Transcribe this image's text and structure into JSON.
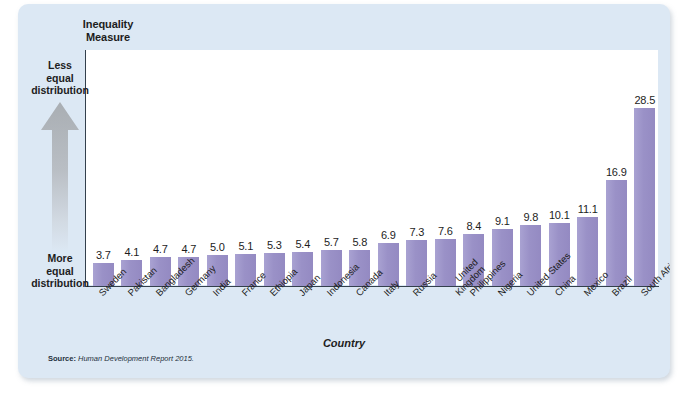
{
  "figure": {
    "y_axis_title": "Inequality\nMeasure",
    "y_axis_title_line1": "Inequality",
    "y_axis_title_line2": "Measure",
    "x_axis_title": "Country",
    "top_annotation": "Less\nequal\ndistribution",
    "top_annotation_line1": "Less",
    "top_annotation_line2": "equal",
    "top_annotation_line3": "distribution",
    "bottom_annotation_line1": "More",
    "bottom_annotation_line2": "equal",
    "bottom_annotation_line3": "distribution",
    "arrow_direction": "up",
    "source_label": "Source:",
    "source_text": "Human Development Report 2015.",
    "bar_color": "#9b93ca",
    "panel_color": "#dce8f4",
    "plot_color": "#ffffff",
    "axis_color": "#33404d"
  },
  "chart_data": {
    "type": "bar",
    "title": "",
    "xlabel": "Country",
    "ylabel": "Inequality Measure",
    "ylim": [
      0,
      30
    ],
    "grid": false,
    "legend": "none",
    "categories": [
      "Sweden",
      "Pakistan",
      "Bangladesh",
      "Germany",
      "India",
      "France",
      "Ethiopia",
      "Japan",
      "Indonesia",
      "Canada",
      "Italy",
      "Russia",
      "United Kingdom",
      "Philippines",
      "Nigeria",
      "United States",
      "China",
      "Mexico",
      "Brazil",
      "South Africa"
    ],
    "values": [
      3.7,
      4.1,
      4.7,
      4.7,
      5.0,
      5.1,
      5.3,
      5.4,
      5.7,
      5.8,
      6.9,
      7.3,
      7.6,
      8.4,
      9.1,
      9.8,
      10.1,
      11.1,
      16.9,
      28.5
    ],
    "value_labels": [
      "3.7",
      "4.1",
      "4.7",
      "4.7",
      "5.0",
      "5.1",
      "5.3",
      "5.4",
      "5.7",
      "5.8",
      "6.9",
      "7.3",
      "7.6",
      "8.4",
      "9.1",
      "9.8",
      "10.1",
      "11.1",
      "16.9",
      "28.5"
    ],
    "annotations": [
      "Less equal distribution (top of axis)",
      "More equal distribution (bottom of axis)"
    ],
    "source": "Human Development Report 2015."
  }
}
